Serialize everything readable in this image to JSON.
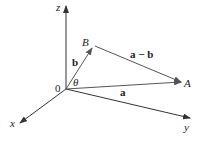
{
  "diagram": {
    "type": "3d-vector-diagram",
    "axes": {
      "x_label": "x",
      "y_label": "y",
      "z_label": "z",
      "origin_label": "0"
    },
    "points": {
      "B_label": "B",
      "A_label": "A"
    },
    "vectors": {
      "b_label": "b",
      "a_label": "a",
      "a_minus_b_label": "a − b"
    },
    "angle_label": "θ",
    "colors": {
      "axis": "#333333",
      "vector": "#555555",
      "text": "#222222"
    }
  }
}
